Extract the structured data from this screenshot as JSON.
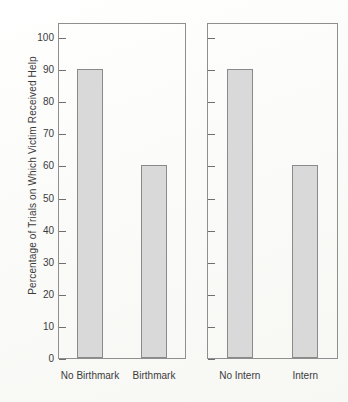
{
  "chart_data": {
    "type": "bar",
    "title": "",
    "subtitle": "",
    "xlabel": "",
    "ylabel": "Percentage of Trials on Which Victim Received Help",
    "ylim": [
      0,
      100
    ],
    "ytick_values": [
      0,
      10,
      20,
      30,
      40,
      50,
      60,
      70,
      80,
      90,
      100
    ],
    "ytick_labels": [
      "0",
      "10",
      "20",
      "30",
      "40",
      "50",
      "60",
      "70",
      "80",
      "90",
      "100"
    ],
    "grid": false,
    "legend": false,
    "legend_position": "none",
    "panels": [
      {
        "name": "birthmark-panel",
        "y_axis_labeled": true,
        "categories": [
          "No Birthmark",
          "Birthmark"
        ],
        "values": [
          90,
          60
        ]
      },
      {
        "name": "intern-panel",
        "y_axis_labeled": false,
        "categories": [
          "No Intern",
          "Intern"
        ],
        "values": [
          90,
          60
        ]
      }
    ],
    "colors": {
      "bar_fill": "#d9d9d9",
      "bar_border": "#8a8a8a",
      "axis": "#8f8f8f",
      "text": "#3b3b3b",
      "background": "#fdfdfc"
    }
  }
}
